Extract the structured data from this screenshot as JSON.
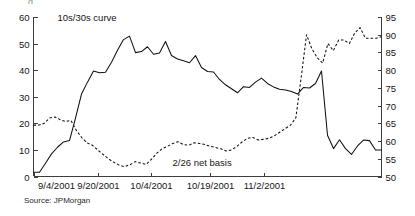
{
  "figure": {
    "source_note": "Source: JPMorgan",
    "clipped_title_fragment": "g"
  },
  "chart_data": {
    "type": "line",
    "title": "",
    "subtitle": "",
    "xlabel": "",
    "ylabel": "",
    "grid": false,
    "legend_position": "inline-annotations",
    "x_tick_labels": [
      "9/4/2001",
      "9/20/2001",
      "10/4/2001",
      "10/19/2001",
      "11/2/2001"
    ],
    "x_tick_indices": [
      0,
      12,
      22,
      33,
      43
    ],
    "x_count": 52,
    "axes": {
      "left": {
        "label": "10s/30s curve (bp)",
        "ylim": [
          0,
          60
        ],
        "ticks": [
          0,
          10,
          20,
          30,
          40,
          50,
          60
        ]
      },
      "right": {
        "label": "2/26 net basis (32nds)",
        "ylim": [
          50,
          95
        ],
        "ticks": [
          50,
          55,
          60,
          65,
          70,
          75,
          80,
          85,
          90,
          95
        ]
      }
    },
    "annotations": [
      {
        "text": "10s/30s curve",
        "x_index": 10.0,
        "axis": "left",
        "value": 58.5
      },
      {
        "text": "2/26 net basis",
        "x_index": 31.5,
        "axis": "right",
        "value": 53.0
      }
    ],
    "series": [
      {
        "name": "10s/30s curve",
        "axis": "left",
        "style": "solid",
        "unit": "bp",
        "values": [
          1.6,
          1.6,
          5.0,
          8.5,
          11.0,
          13.0,
          13.5,
          22.0,
          31.0,
          35.5,
          39.7,
          39.0,
          39.2,
          43.0,
          47.5,
          51.5,
          52.8,
          46.6,
          47.0,
          48.8,
          46.0,
          46.5,
          50.8,
          45.5,
          44.2,
          43.5,
          42.8,
          45.5,
          41.0,
          39.5,
          39.3,
          36.5,
          34.5,
          33.0,
          31.5,
          33.8,
          33.5,
          35.5,
          37.0,
          35.0,
          33.7,
          32.8,
          32.5,
          32.0,
          31.0,
          33.5,
          33.3,
          35.0,
          39.7,
          15.5,
          10.5,
          13.8,
          10.5,
          8.3,
          11.5,
          13.7,
          13.5,
          10.0,
          10.0
        ]
      },
      {
        "name": "2/26 net basis",
        "axis": "right",
        "style": "dashed",
        "unit": "32nds",
        "values": [
          64.5,
          64.5,
          65.0,
          66.5,
          66.8,
          66.0,
          65.5,
          65.8,
          63.0,
          61.0,
          59.5,
          58.8,
          57.5,
          56.2,
          55.0,
          54.0,
          53.2,
          52.8,
          53.3,
          54.2,
          53.8,
          53.4,
          54.8,
          56.5,
          57.8,
          58.5,
          59.3,
          59.8,
          59.0,
          58.8,
          59.5,
          59.3,
          59.0,
          58.5,
          58.2,
          57.8,
          57.2,
          57.5,
          58.5,
          59.8,
          60.8,
          61.0,
          60.3,
          60.5,
          60.8,
          61.5,
          62.5,
          63.5,
          64.5,
          66.5,
          78.0,
          90.0,
          86.0,
          83.5,
          82.0,
          87.5,
          85.5,
          88.5,
          88.5,
          87.5,
          90.5,
          92.0,
          89.0,
          89.0,
          89.0,
          89.5
        ]
      }
    ]
  }
}
